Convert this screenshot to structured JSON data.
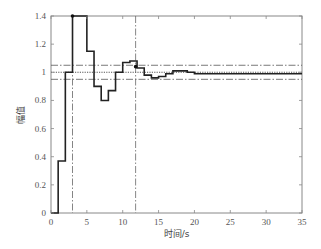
{
  "chart_data": {
    "type": "line",
    "style": "step",
    "title": "",
    "xlabel": "时间/s",
    "ylabel": "幅值",
    "xlim": [
      0,
      35
    ],
    "ylim": [
      0,
      1.4
    ],
    "xticks": [
      0,
      5,
      10,
      15,
      20,
      25,
      30,
      35
    ],
    "yticks": [
      0,
      0.2,
      0.4,
      0.6,
      0.8,
      1,
      1.2,
      1.4
    ],
    "xtick_labels": [
      "0",
      "5",
      "10",
      "15",
      "20",
      "25",
      "30",
      "35"
    ],
    "ytick_labels": [
      "0",
      "0.2",
      "0.4",
      "0.6",
      "0.8",
      "1",
      "1.2",
      "1.4"
    ],
    "grid": false,
    "series": [
      {
        "name": "step response",
        "x": [
          0,
          1,
          2,
          3,
          4,
          5,
          6,
          7,
          8,
          9,
          10,
          11,
          12,
          13,
          14,
          15,
          16,
          17,
          18,
          19,
          20,
          21,
          22,
          23,
          24,
          25,
          26,
          27,
          28,
          29,
          30,
          31,
          32,
          33,
          34,
          35
        ],
        "values": [
          0,
          0.37,
          1.0,
          1.4,
          1.4,
          1.15,
          0.9,
          0.8,
          0.87,
          1.0,
          1.07,
          1.08,
          1.03,
          0.98,
          0.96,
          0.97,
          0.99,
          1.01,
          1.01,
          1.0,
          0.99,
          0.99,
          0.99,
          0.99,
          0.99,
          0.99,
          0.99,
          0.99,
          0.99,
          0.99,
          0.99,
          0.99,
          0.99,
          0.99,
          0.99,
          0.99
        ]
      }
    ],
    "reference_lines": {
      "horizontal": [
        {
          "y": 1.05,
          "style": "dash-dot"
        },
        {
          "y": 1.0,
          "style": "dotted"
        },
        {
          "y": 0.95,
          "style": "dash-dot"
        }
      ],
      "vertical": [
        {
          "x": 3,
          "style": "dash-dot",
          "label": "peak time"
        },
        {
          "x": 11.8,
          "style": "dash-dot",
          "label": "settling time"
        }
      ]
    },
    "markers": [
      {
        "x": 3,
        "y": 1.4
      },
      {
        "x": 11.8,
        "y": 1.04
      }
    ],
    "legend": null
  },
  "plot_area": {
    "left": 51,
    "top": 16,
    "right": 302,
    "bottom": 213
  }
}
